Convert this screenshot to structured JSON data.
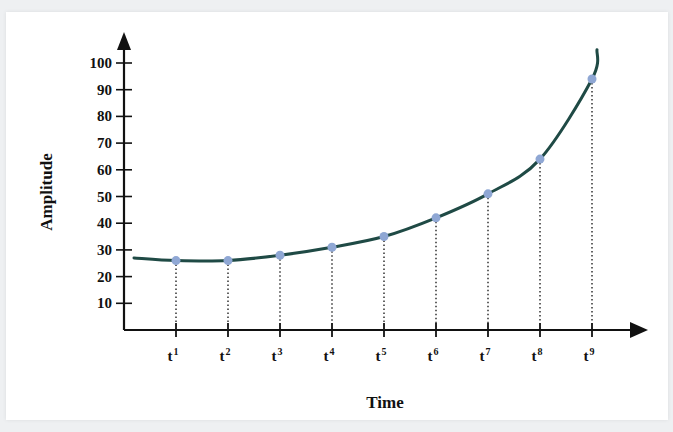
{
  "chart_data": {
    "type": "line",
    "title": "",
    "xlabel": "Time",
    "ylabel": "Amplitude",
    "ylim": [
      0,
      100
    ],
    "y_ticks": [
      10,
      20,
      30,
      40,
      50,
      60,
      70,
      80,
      90,
      100
    ],
    "categories": [
      "t1",
      "t2",
      "t3",
      "t4",
      "t5",
      "t6",
      "t7",
      "t8",
      "t9"
    ],
    "category_labels": [
      {
        "base": "t",
        "sup": "1"
      },
      {
        "base": "t",
        "sup": "2"
      },
      {
        "base": "t",
        "sup": "3"
      },
      {
        "base": "t",
        "sup": "4"
      },
      {
        "base": "t",
        "sup": "5"
      },
      {
        "base": "t",
        "sup": "6"
      },
      {
        "base": "t",
        "sup": "7"
      },
      {
        "base": "t",
        "sup": "8"
      },
      {
        "base": "t",
        "sup": "9"
      }
    ],
    "series": [
      {
        "name": "Amplitude",
        "values": [
          26,
          26,
          28,
          31,
          35,
          42,
          51,
          64,
          94
        ]
      }
    ],
    "curve_start_value": 27,
    "curve_end_value": 105,
    "grid": false,
    "legend": "none",
    "drop_lines": "dotted vertical lines from each point to the time axis",
    "colors": {
      "curve": "#1f4a45",
      "marker": "#8fa7d4",
      "axis": "#111111"
    }
  }
}
